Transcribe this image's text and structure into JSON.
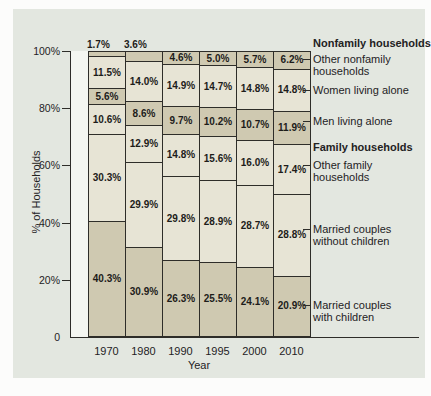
{
  "figure": {
    "panel_color": "#e3e7e0",
    "margin_color": "#fcfcfb"
  },
  "chart_data": {
    "type": "bar",
    "subtype": "stacked-100-percent",
    "title": "",
    "xlabel": "Year",
    "ylabel": "% of Households",
    "x": [
      "1970",
      "1980",
      "1990",
      "1995",
      "2000",
      "2010"
    ],
    "ylim": [
      0,
      100
    ],
    "grid": false,
    "yticks": [
      {
        "label": "0",
        "value": 0
      },
      {
        "label": "20%",
        "value": 20
      },
      {
        "label": "40%",
        "value": 40
      },
      {
        "label": "60%",
        "value": 60
      },
      {
        "label": "80%",
        "value": 80
      },
      {
        "label": "100%",
        "value": 100
      }
    ],
    "series": [
      {
        "name": "Married couples with children",
        "shade": "dark",
        "values": [
          40.3,
          30.9,
          26.3,
          25.5,
          24.1,
          20.9
        ]
      },
      {
        "name": "Married couples without children",
        "shade": "light",
        "values": [
          30.3,
          29.9,
          29.8,
          28.9,
          28.7,
          28.8
        ]
      },
      {
        "name": "Other family households",
        "shade": "light",
        "values": [
          10.6,
          12.9,
          14.8,
          15.6,
          16.0,
          17.4
        ]
      },
      {
        "name": "Men living alone",
        "shade": "dark",
        "values": [
          5.6,
          8.6,
          9.7,
          10.2,
          10.7,
          11.9
        ]
      },
      {
        "name": "Women living alone",
        "shade": "light",
        "values": [
          11.5,
          14.0,
          14.9,
          14.7,
          14.8,
          14.8
        ]
      },
      {
        "name": "Other nonfamily households",
        "shade": "dark",
        "values": [
          1.7,
          3.6,
          4.6,
          5.0,
          5.7,
          6.2
        ]
      }
    ],
    "colors": {
      "light": "#e7e4d5",
      "dark": "#cfc9b1",
      "line": "#2e2d29",
      "text": "#1d1c1a"
    },
    "annotations": [
      {
        "type": "header",
        "label": "Nonfamily households",
        "lines": [
          "Nonfamily households"
        ],
        "y": 43
      },
      {
        "type": "series",
        "label": "Other nonfamily households",
        "lines": [
          "Other nonfamily",
          "households"
        ],
        "y": 59
      },
      {
        "type": "series",
        "label": "Women living alone",
        "lines": [
          "Women living alone"
        ],
        "y": 90
      },
      {
        "type": "series",
        "label": "Men living alone",
        "lines": [
          "Men living alone"
        ],
        "y": 121
      },
      {
        "type": "header",
        "label": "Family households",
        "lines": [
          "Family households"
        ],
        "y": 147
      },
      {
        "type": "series",
        "label": "Other family households",
        "lines": [
          "Other family",
          "households"
        ],
        "y": 165
      },
      {
        "type": "series",
        "label": "Married couples without children",
        "lines": [
          "Married couples",
          "without children"
        ],
        "y": 229
      },
      {
        "type": "series",
        "label": "Married couples with children",
        "lines": [
          "Married couples",
          "with children"
        ],
        "y": 305
      }
    ]
  }
}
